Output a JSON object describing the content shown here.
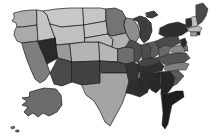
{
  "figure": {
    "background_color": "#ffffff",
    "border_color": "#1a1a1a",
    "width_px": 220,
    "height_px": 139
  },
  "chart_data": {
    "type": "map",
    "subtype": "choropleth",
    "xlabel": "",
    "ylabel": "",
    "legend": "none",
    "grid": false,
    "projection": "albers-usa",
    "color_scale": {
      "name": "grayscale-sequential",
      "direction": "light-to-dark",
      "stops": [
        "#e8e8e8",
        "#d2d2d2",
        "#b8b8b8",
        "#9a9a9a",
        "#7a7a7a",
        "#585858",
        "#3a3a3a",
        "#202020"
      ],
      "min_label": "low",
      "max_label": "high"
    },
    "regions": [
      {
        "code": "WA",
        "name": "Washington",
        "value": 3,
        "fill": "#b0b0b0"
      },
      {
        "code": "OR",
        "name": "Oregon",
        "value": 3,
        "fill": "#aaaaaa"
      },
      {
        "code": "CA",
        "name": "California",
        "value": 5,
        "fill": "#7e7e7e"
      },
      {
        "code": "NV",
        "name": "Nevada",
        "value": 7,
        "fill": "#2a2a2a"
      },
      {
        "code": "ID",
        "name": "Idaho",
        "value": 2,
        "fill": "#c4c4c4"
      },
      {
        "code": "MT",
        "name": "Montana",
        "value": 2,
        "fill": "#c8c8c8"
      },
      {
        "code": "WY",
        "name": "Wyoming",
        "value": 2,
        "fill": "#c0c0c0"
      },
      {
        "code": "UT",
        "name": "Utah",
        "value": 4,
        "fill": "#999999"
      },
      {
        "code": "AZ",
        "name": "Arizona",
        "value": 6,
        "fill": "#4a4a4a"
      },
      {
        "code": "CO",
        "name": "Colorado",
        "value": 3,
        "fill": "#b4b4b4"
      },
      {
        "code": "NM",
        "name": "New Mexico",
        "value": 6,
        "fill": "#424242"
      },
      {
        "code": "ND",
        "name": "North Dakota",
        "value": 2,
        "fill": "#c6c6c6"
      },
      {
        "code": "SD",
        "name": "South Dakota",
        "value": 2,
        "fill": "#c2c2c2"
      },
      {
        "code": "NE",
        "name": "Nebraska",
        "value": 3,
        "fill": "#bcbcbc"
      },
      {
        "code": "KS",
        "name": "Kansas",
        "value": 3,
        "fill": "#b6b6b6"
      },
      {
        "code": "OK",
        "name": "Oklahoma",
        "value": 6,
        "fill": "#464646"
      },
      {
        "code": "TX",
        "name": "Texas",
        "value": 4,
        "fill": "#a4a4a4"
      },
      {
        "code": "MN",
        "name": "Minnesota",
        "value": 5,
        "fill": "#747474"
      },
      {
        "code": "IA",
        "name": "Iowa",
        "value": 3,
        "fill": "#b2b2b2"
      },
      {
        "code": "MO",
        "name": "Missouri",
        "value": 5,
        "fill": "#6e6e6e"
      },
      {
        "code": "AR",
        "name": "Arkansas",
        "value": 7,
        "fill": "#343434"
      },
      {
        "code": "LA",
        "name": "Louisiana",
        "value": 7,
        "fill": "#2e2e2e"
      },
      {
        "code": "WI",
        "name": "Wisconsin",
        "value": 4,
        "fill": "#8e8e8e"
      },
      {
        "code": "IL",
        "name": "Illinois",
        "value": 6,
        "fill": "#4e4e4e"
      },
      {
        "code": "MI",
        "name": "Michigan",
        "value": 6,
        "fill": "#3e3e3e"
      },
      {
        "code": "IN",
        "name": "Indiana",
        "value": 6,
        "fill": "#4c4c4c"
      },
      {
        "code": "OH",
        "name": "Ohio",
        "value": 5,
        "fill": "#5c5c5c"
      },
      {
        "code": "KY",
        "name": "Kentucky",
        "value": 6,
        "fill": "#444444"
      },
      {
        "code": "TN",
        "name": "Tennessee",
        "value": 7,
        "fill": "#303030"
      },
      {
        "code": "MS",
        "name": "Mississippi",
        "value": 7,
        "fill": "#2c2c2c"
      },
      {
        "code": "AL",
        "name": "Alabama",
        "value": 7,
        "fill": "#282828"
      },
      {
        "code": "GA",
        "name": "Georgia",
        "value": 7,
        "fill": "#262626"
      },
      {
        "code": "FL",
        "name": "Florida",
        "value": 8,
        "fill": "#1e1e1e"
      },
      {
        "code": "SC",
        "name": "South Carolina",
        "value": 6,
        "fill": "#5a5a5a"
      },
      {
        "code": "NC",
        "name": "North Carolina",
        "value": 5,
        "fill": "#808080"
      },
      {
        "code": "VA",
        "name": "Virginia",
        "value": 6,
        "fill": "#545454"
      },
      {
        "code": "WV",
        "name": "West Virginia",
        "value": 5,
        "fill": "#6a6a6a"
      },
      {
        "code": "PA",
        "name": "Pennsylvania",
        "value": 6,
        "fill": "#4a4a4a"
      },
      {
        "code": "NY",
        "name": "New York",
        "value": 7,
        "fill": "#2e2e2e"
      },
      {
        "code": "VT",
        "name": "Vermont",
        "value": 7,
        "fill": "#303030"
      },
      {
        "code": "NH",
        "name": "New Hampshire",
        "value": 3,
        "fill": "#c0c0c0"
      },
      {
        "code": "ME",
        "name": "Maine",
        "value": 6,
        "fill": "#4a4a4a"
      },
      {
        "code": "MA",
        "name": "Massachusetts",
        "value": 3,
        "fill": "#bdbdbd"
      },
      {
        "code": "RI",
        "name": "Rhode Island",
        "value": 7,
        "fill": "#343434"
      },
      {
        "code": "CT",
        "name": "Connecticut",
        "value": 4,
        "fill": "#9c9c9c"
      },
      {
        "code": "NJ",
        "name": "New Jersey",
        "value": 7,
        "fill": "#2a2a2a"
      },
      {
        "code": "DE",
        "name": "Delaware",
        "value": 5,
        "fill": "#707070"
      },
      {
        "code": "MD",
        "name": "Maryland",
        "value": 4,
        "fill": "#8a8a8a"
      },
      {
        "code": "AK",
        "name": "Alaska",
        "value": 5,
        "fill": "#6c6c6c"
      },
      {
        "code": "HI",
        "name": "Hawaii",
        "value": 5,
        "fill": "#707070"
      }
    ]
  }
}
